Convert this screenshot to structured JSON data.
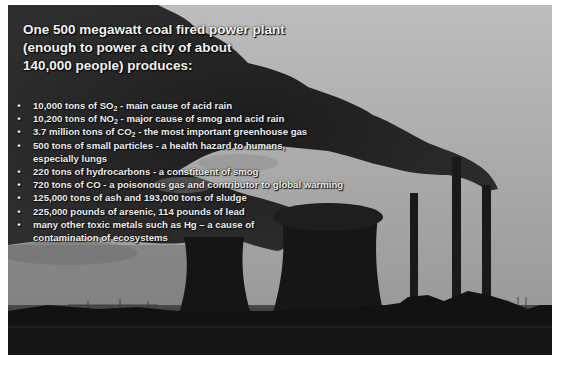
{
  "slide": {
    "title_lines": [
      "One 500 megawatt coal fired power plant",
      "(enough to power a city of about",
      "140,000 people) produces:"
    ],
    "bullet_glyph": "•",
    "bullets": [
      {
        "pre": "10,000 tons of SO",
        "sub": "2",
        "post": " - main cause of acid rain"
      },
      {
        "pre": "10,200 tons of NO",
        "sub": "2",
        "post": " - major cause of smog and acid rain"
      },
      {
        "pre": "3.7 million tons of CO",
        "sub": "2",
        "post": " - the most important greenhouse gas"
      },
      {
        "pre": "500 tons of small particles - a health hazard to humans, especially lungs",
        "sub": "",
        "post": ""
      },
      {
        "pre": "220 tons of hydrocarbons - a constituent of smog",
        "sub": "",
        "post": ""
      },
      {
        "pre": "720 tons of CO - a poisonous gas and contributor to global warming",
        "sub": "",
        "post": ""
      },
      {
        "pre": "125,000 tons of ash and 193,000 tons of sludge",
        "sub": "",
        "post": ""
      },
      {
        "pre": "225,000 pounds of arsenic, 114 pounds of lead",
        "sub": "",
        "post": ""
      },
      {
        "pre": "many other toxic metals such as Hg – a cause of contamination of ecosystems",
        "sub": "",
        "post": ""
      }
    ],
    "background_image": "coal-power-plant-smokestacks-photo",
    "colors": {
      "sky": "#b0b0b0",
      "smoke": "#2a2a2a",
      "silhouette": "#141414",
      "text": "#f0f0f0"
    }
  }
}
